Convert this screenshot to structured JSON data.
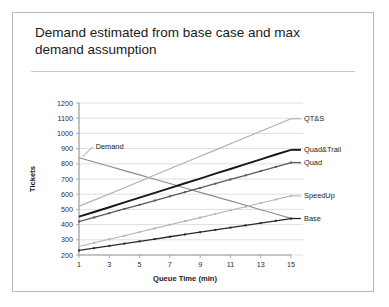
{
  "slide": {
    "title": "Demand estimated from base case and max demand assumption"
  },
  "callout": {
    "label": "Demand"
  },
  "colors": {
    "frame": "#b9b9b9",
    "rule": "#c9c9c9",
    "grid": "#d7d7d7",
    "axis": "#9a9a9a",
    "demand": "#8d8d8d",
    "qts": "#aeaeae",
    "quadtrail": "#171717",
    "quad": "#5a5a5a",
    "speedup": "#b4b4b4",
    "base": "#2a2a2a"
  },
  "chart_data": {
    "type": "line",
    "title": "",
    "xlabel": "Queue Time (min)",
    "ylabel": "Tickets",
    "x": [
      1,
      2,
      3,
      4,
      5,
      6,
      7,
      8,
      9,
      10,
      11,
      12,
      13,
      14,
      15
    ],
    "xticks": [
      1,
      3,
      5,
      7,
      9,
      11,
      13,
      15
    ],
    "xlim": [
      1,
      15
    ],
    "ylim": [
      200,
      1200
    ],
    "yticks": [
      200,
      300,
      400,
      500,
      600,
      700,
      800,
      900,
      1000,
      1100,
      1200
    ],
    "grid": true,
    "legend": "right-inline-labels",
    "series": [
      {
        "name": "Demand",
        "label_x": 1,
        "values": [
          840,
          812,
          784,
          755,
          727,
          698,
          670,
          641,
          612,
          584,
          556,
          527,
          498,
          470,
          441
        ]
      },
      {
        "name": "QT&S",
        "label_x": 15,
        "values": [
          520,
          561,
          602,
          643,
          684,
          726,
          767,
          808,
          849,
          890,
          932,
          973,
          1014,
          1055,
          1096
        ]
      },
      {
        "name": "Quad&Trail",
        "label_x": 15,
        "values": [
          452,
          483,
          514,
          546,
          577,
          609,
          640,
          672,
          703,
          735,
          766,
          798,
          829,
          861,
          892
        ]
      },
      {
        "name": "Quad",
        "label_x": 15,
        "values": [
          420,
          447,
          475,
          503,
          530,
          558,
          586,
          614,
          641,
          669,
          697,
          724,
          752,
          780,
          808
        ]
      },
      {
        "name": "SpeedUp",
        "label_x": 15,
        "values": [
          256,
          280,
          304,
          327,
          351,
          375,
          399,
          423,
          446,
          470,
          494,
          518,
          542,
          565,
          589
        ]
      },
      {
        "name": "Base",
        "label_x": 15,
        "values": [
          230,
          245,
          260,
          275,
          290,
          305,
          320,
          335,
          350,
          365,
          380,
          395,
          410,
          425,
          440
        ]
      }
    ]
  }
}
